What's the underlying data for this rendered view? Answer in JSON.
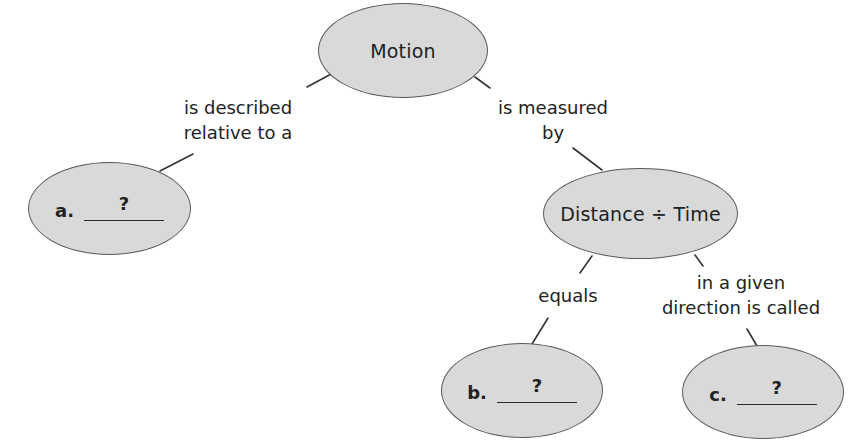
{
  "diagram": {
    "type": "concept-map",
    "colors": {
      "node_fill": "#d9d9d9",
      "node_stroke": "#5a5a5a",
      "line": "#333333",
      "text": "#222222"
    },
    "nodes": {
      "motion": {
        "label": "Motion"
      },
      "distance_time": {
        "label": "Distance ÷ Time"
      },
      "a": {
        "letter": "a.",
        "answer": "?"
      },
      "b": {
        "letter": "b.",
        "answer": "?"
      },
      "c": {
        "letter": "c.",
        "answer": "?"
      }
    },
    "links": {
      "motion_to_a": {
        "line1": "is described",
        "line2": "relative to a"
      },
      "motion_to_distance": {
        "line1": "is measured",
        "line2": "by"
      },
      "distance_to_b": {
        "line1": "equals"
      },
      "distance_to_c": {
        "line1": "in a given",
        "line2": "direction is called"
      }
    }
  }
}
